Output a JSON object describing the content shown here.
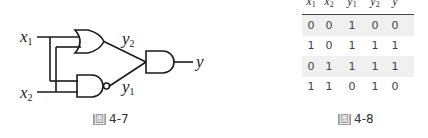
{
  "figure_left": {
    "caption_prefix": "圖",
    "caption_number": "4-7",
    "inputs": [
      {
        "name": "x",
        "sub": "1"
      },
      {
        "name": "x",
        "sub": "2"
      }
    ],
    "intermediate": [
      {
        "name": "y",
        "sub": "2",
        "gate": "OR"
      },
      {
        "name": "y",
        "sub": "1",
        "gate": "NAND"
      }
    ],
    "output": {
      "name": "y",
      "gate": "AND"
    }
  },
  "figure_right": {
    "caption_prefix": "圖",
    "caption_number": "4-8",
    "headers": [
      {
        "name": "x",
        "sub": "1"
      },
      {
        "name": "x",
        "sub": "2"
      },
      {
        "name": "y",
        "sub": "1"
      },
      {
        "name": "y",
        "sub": "2"
      },
      {
        "name": "y",
        "sub": ""
      }
    ],
    "rows": [
      [
        "0",
        "0",
        "1",
        "0",
        "0"
      ],
      [
        "1",
        "0",
        "1",
        "1",
        "1"
      ],
      [
        "0",
        "1",
        "1",
        "1",
        "1"
      ],
      [
        "1",
        "1",
        "0",
        "1",
        "0"
      ]
    ]
  },
  "colors": {
    "line": "#1a1a1a",
    "row_shade": "#f0f0f0"
  }
}
